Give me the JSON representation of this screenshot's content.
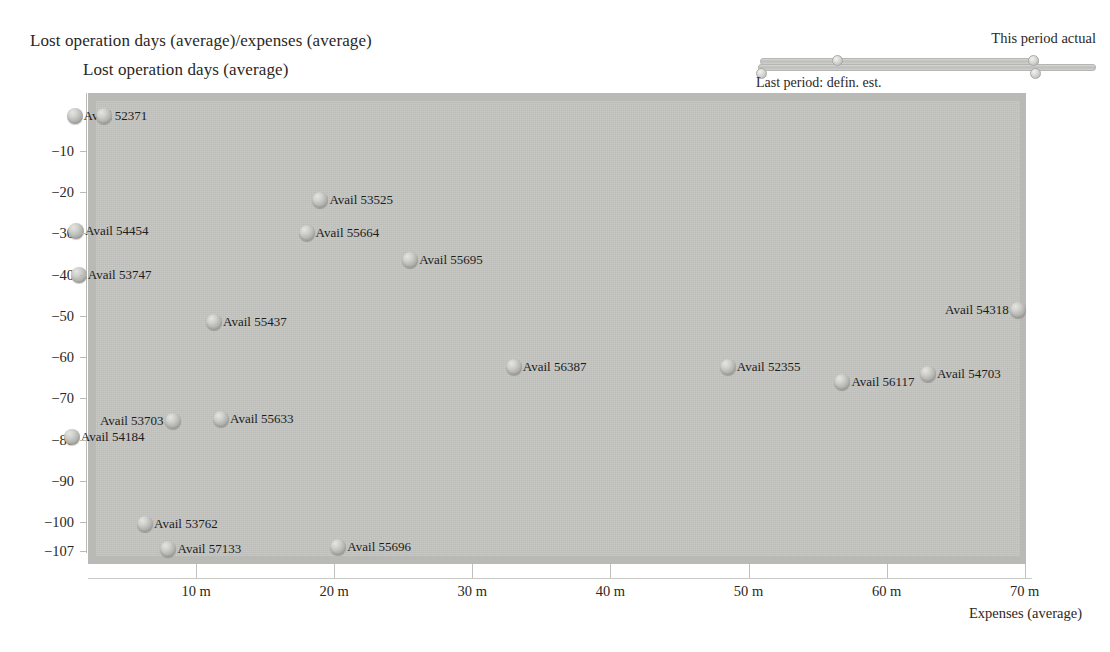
{
  "titles": {
    "main": "Lost operation days (average)/expenses (average)",
    "sub": "Lost operation days (average)"
  },
  "legend": {
    "top_label": "This period actual",
    "bottom_label": "Last period: defin. est."
  },
  "axes": {
    "x_title": "Expenses (average)",
    "x_ticks": [
      "10 m",
      "20 m",
      "30 m",
      "40 m",
      "50 m",
      "60 m",
      "70 m"
    ],
    "y_ticks": [
      "−10",
      "−20",
      "−30",
      "−40",
      "−50",
      "−60",
      "−70",
      "−80",
      "−90",
      "−100",
      "−107"
    ]
  },
  "colors": {
    "plot_background": "#c3c3c0",
    "plot_border": "#b9b9b6",
    "marker": "#a9a9a5",
    "text": "#231f20",
    "page_background": "#ffffff"
  },
  "chart_data": {
    "type": "scatter",
    "title": "Lost operation days (average)/expenses (average)",
    "xlabel": "Expenses (average)",
    "ylabel": "Lost operation days (average)",
    "xlim": [
      0,
      72
    ],
    "ylim": [
      -107,
      0
    ],
    "x_unit": "m",
    "grid": false,
    "legend_position": "top-right",
    "points": [
      {
        "label": "Avail 52371",
        "x": 1.2,
        "y": -1.5,
        "label_side": "right"
      },
      {
        "label": "Avail 52371b",
        "x": 3.3,
        "y": -1.5,
        "label_side": "none"
      },
      {
        "label": "Avail 53525",
        "x": 19.0,
        "y": -22.0,
        "label_side": "right"
      },
      {
        "label": "Avail 54454",
        "x": 1.3,
        "y": -29.5,
        "label_side": "right"
      },
      {
        "label": "Avail 55664",
        "x": 18.0,
        "y": -30.0,
        "label_side": "right"
      },
      {
        "label": "Avail 55695",
        "x": 25.5,
        "y": -36.5,
        "label_side": "right"
      },
      {
        "label": "Avail 53747",
        "x": 1.5,
        "y": -40.0,
        "label_side": "right"
      },
      {
        "label": "Avail 54318",
        "x": 69.5,
        "y": -48.5,
        "label_side": "left"
      },
      {
        "label": "Avail 55437",
        "x": 11.3,
        "y": -51.5,
        "label_side": "right"
      },
      {
        "label": "Avail 56387",
        "x": 33.0,
        "y": -62.5,
        "label_side": "right"
      },
      {
        "label": "Avail 52355",
        "x": 48.5,
        "y": -62.5,
        "label_side": "right"
      },
      {
        "label": "Avail 54703",
        "x": 63.0,
        "y": -64.0,
        "label_side": "right"
      },
      {
        "label": "Avail 56117",
        "x": 56.8,
        "y": -66.0,
        "label_side": "right"
      },
      {
        "label": "Avail 55633",
        "x": 11.8,
        "y": -75.0,
        "label_side": "right"
      },
      {
        "label": "Avail 53703",
        "x": 8.3,
        "y": -75.5,
        "label_side": "left"
      },
      {
        "label": "Avail 54184",
        "x": 1.0,
        "y": -79.5,
        "label_side": "right"
      },
      {
        "label": "Avail 53762",
        "x": 6.3,
        "y": -100.5,
        "label_side": "right"
      },
      {
        "label": "Avail 57133",
        "x": 8.0,
        "y": -106.5,
        "label_side": "right"
      },
      {
        "label": "Avail 55696",
        "x": 20.3,
        "y": -106.0,
        "label_side": "right"
      }
    ]
  }
}
